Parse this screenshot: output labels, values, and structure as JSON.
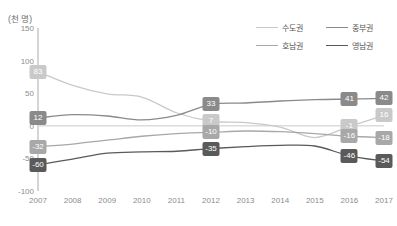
{
  "chart_data": {
    "type": "line",
    "title": "",
    "xlabel": "",
    "ylabel": "(천 명)",
    "ylim": [
      -100,
      150
    ],
    "grid": false,
    "legend_position": "top-right",
    "x": [
      "2007",
      "2008",
      "2009",
      "2010",
      "2011",
      "2012",
      "2013",
      "2014",
      "2015",
      "2016",
      "2017"
    ],
    "yticks": [
      "150",
      "100",
      "50",
      "0",
      "-50",
      "-100"
    ],
    "series": [
      {
        "name": "수도권",
        "color": "#c9c9c9",
        "values": [
          83,
          62,
          49,
          44,
          20,
          7,
          5,
          -2,
          -18,
          -1,
          16
        ],
        "labels": [
          {
            "x": "2007",
            "value": "83"
          },
          {
            "x": "2012",
            "value": "7"
          },
          {
            "x": "2016",
            "value": "-1"
          },
          {
            "x": "2017",
            "value": "16"
          }
        ]
      },
      {
        "name": "중부권",
        "color": "#8a8a8a",
        "values": [
          12,
          17,
          15,
          9,
          16,
          33,
          35,
          38,
          40,
          41,
          42
        ],
        "labels": [
          {
            "x": "2007",
            "value": "12"
          },
          {
            "x": "2012",
            "value": "33"
          },
          {
            "x": "2016",
            "value": "41"
          },
          {
            "x": "2017",
            "value": "42"
          }
        ]
      },
      {
        "name": "호남권",
        "color": "#a8a8a8",
        "values": [
          -32,
          -28,
          -22,
          -16,
          -12,
          -10,
          -8,
          -9,
          -12,
          -16,
          -18
        ],
        "labels": [
          {
            "x": "2007",
            "value": "-32"
          },
          {
            "x": "2012",
            "value": "-10"
          },
          {
            "x": "2016",
            "value": "-16"
          },
          {
            "x": "2017",
            "value": "-18"
          }
        ]
      },
      {
        "name": "영남권",
        "color": "#5a5a5a",
        "values": [
          -60,
          -51,
          -42,
          -40,
          -39,
          -35,
          -32,
          -30,
          -31,
          -46,
          -54
        ],
        "labels": [
          {
            "x": "2007",
            "value": "-60"
          },
          {
            "x": "2012",
            "value": "-35"
          },
          {
            "x": "2016",
            "value": "-46"
          },
          {
            "x": "2017",
            "value": "-54"
          }
        ]
      }
    ]
  }
}
